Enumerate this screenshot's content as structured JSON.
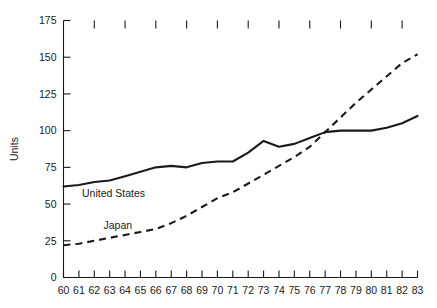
{
  "chart_data": {
    "type": "line",
    "title": "",
    "xlabel": "",
    "ylabel": "Units",
    "xlim": [
      60,
      83
    ],
    "ylim": [
      0,
      175
    ],
    "grid": false,
    "legend_position": "inline-annotation",
    "x": [
      60,
      61,
      62,
      63,
      64,
      65,
      66,
      67,
      68,
      69,
      70,
      71,
      72,
      73,
      74,
      75,
      76,
      77,
      78,
      79,
      80,
      81,
      82,
      83
    ],
    "xtick_labels": [
      "60",
      "61",
      "62",
      "63",
      "64",
      "65",
      "66",
      "67",
      "68",
      "69",
      "70",
      "71",
      "72",
      "73",
      "74",
      "75",
      "76",
      "77",
      "78",
      "79",
      "80",
      "81",
      "82",
      "83"
    ],
    "ytick_labels": [
      "0",
      "25",
      "50",
      "75",
      "100",
      "125",
      "150",
      "175"
    ],
    "ytick_values": [
      0,
      25,
      50,
      75,
      100,
      125,
      150,
      175
    ],
    "series": [
      {
        "name": "United States",
        "style": "solid",
        "label_x": 61.2,
        "label_y": 55,
        "values": [
          62,
          63,
          65,
          66,
          69,
          72,
          75,
          76,
          75,
          78,
          79,
          79,
          85,
          93,
          89,
          91,
          95,
          99,
          100,
          100,
          100,
          102,
          105,
          110
        ]
      },
      {
        "name": "Japan",
        "style": "dashed",
        "label_x": 62.6,
        "label_y": 33,
        "values": [
          22,
          23,
          25,
          27,
          29,
          31,
          33,
          37,
          42,
          48,
          54,
          58,
          64,
          70,
          76,
          82,
          89,
          99,
          109,
          119,
          128,
          137,
          146,
          152
        ]
      }
    ],
    "annotations": []
  }
}
